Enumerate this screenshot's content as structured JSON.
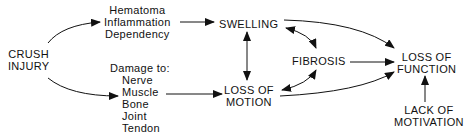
{
  "diagram": {
    "nodes": {
      "crush_injury": {
        "lines": [
          "CRUSH",
          "INJURY"
        ]
      },
      "hematoma_group": {
        "lines": [
          "Hematoma",
          "Inflammation",
          "Dependency"
        ]
      },
      "damage_group": {
        "header": "Damage to:",
        "items": [
          "Nerve",
          "Muscle",
          "Bone",
          "Joint",
          "Tendon"
        ]
      },
      "swelling": {
        "lines": [
          "SWELLING"
        ]
      },
      "loss_of_motion": {
        "lines": [
          "LOSS OF",
          "MOTION"
        ]
      },
      "fibrosis": {
        "lines": [
          "FIBROSIS"
        ]
      },
      "loss_of_function": {
        "lines": [
          "LOSS OF",
          "FUNCTION"
        ]
      },
      "lack_of_motivation": {
        "lines": [
          "LACK OF",
          "MOTIVATION"
        ]
      }
    },
    "edges": [
      {
        "from": "CRUSH INJURY",
        "to": "Hematoma/Inflammation/Dependency",
        "type": "arrow"
      },
      {
        "from": "CRUSH INJURY",
        "to": "Damage to",
        "type": "arrow"
      },
      {
        "from": "Hematoma/Inflammation/Dependency",
        "to": "SWELLING",
        "type": "arrow"
      },
      {
        "from": "Damage to",
        "to": "LOSS OF MOTION",
        "type": "arrow"
      },
      {
        "from": "SWELLING",
        "to": "LOSS OF MOTION",
        "type": "bidirectional"
      },
      {
        "from": "SWELLING",
        "to": "FIBROSIS",
        "type": "bidirectional"
      },
      {
        "from": "LOSS OF MOTION",
        "to": "FIBROSIS",
        "type": "bidirectional"
      },
      {
        "from": "SWELLING",
        "to": "LOSS OF FUNCTION",
        "type": "arrow"
      },
      {
        "from": "FIBROSIS",
        "to": "LOSS OF FUNCTION",
        "type": "arrow"
      },
      {
        "from": "LOSS OF MOTION",
        "to": "LOSS OF FUNCTION",
        "type": "arrow"
      },
      {
        "from": "LACK OF MOTIVATION",
        "to": "LOSS OF FUNCTION",
        "type": "arrow"
      }
    ]
  }
}
